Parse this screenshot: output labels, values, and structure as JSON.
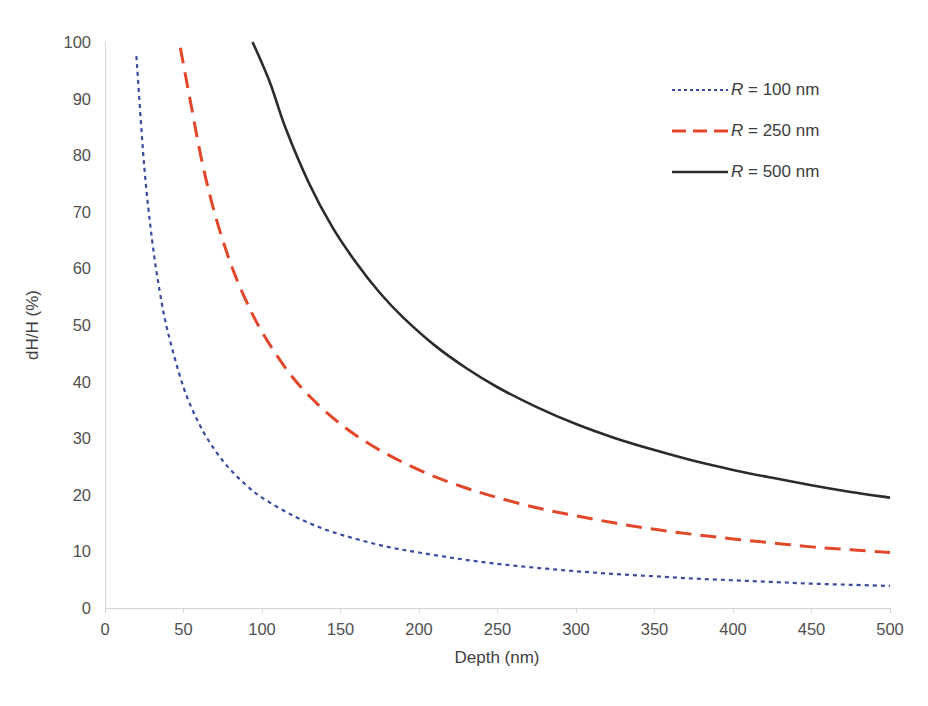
{
  "chart_data": {
    "type": "line",
    "title": "",
    "xlabel": "Depth (nm)",
    "ylabel": "dH/H (%)",
    "xlim": [
      0,
      500
    ],
    "ylim": [
      0,
      100
    ],
    "xticks": [
      0,
      50,
      100,
      150,
      200,
      250,
      300,
      350,
      400,
      450,
      500
    ],
    "yticks": [
      0,
      10,
      20,
      30,
      40,
      50,
      60,
      70,
      80,
      90,
      100
    ],
    "grid": false,
    "legend_position": "upper right",
    "series": [
      {
        "name": "R = 100 nm",
        "legend_symbol": "R",
        "legend_rest": " = 100 nm",
        "radius_nm": 100,
        "color": "#3b4ba0",
        "dash": "4,4",
        "width": 2.2,
        "x": [
          20,
          25,
          30,
          35,
          40,
          50,
          60,
          70,
          80,
          90,
          100,
          120,
          140,
          160,
          180,
          200,
          225,
          250,
          275,
          300,
          325,
          350,
          375,
          400,
          425,
          450,
          475,
          500
        ],
        "y": [
          97.5,
          78.0,
          65.0,
          55.7,
          48.8,
          39.0,
          32.5,
          27.9,
          24.4,
          21.7,
          19.5,
          16.3,
          13.9,
          12.2,
          10.8,
          9.8,
          8.7,
          7.8,
          7.1,
          6.5,
          6.0,
          5.6,
          5.2,
          4.9,
          4.6,
          4.3,
          4.1,
          3.9
        ]
      },
      {
        "name": "R = 250 nm",
        "legend_symbol": "R",
        "legend_rest": " = 250 nm",
        "radius_nm": 250,
        "color": "#e2472a",
        "dash": "16,9",
        "width": 3.0,
        "x": [
          48,
          55,
          62,
          70,
          80,
          90,
          100,
          115,
          130,
          150,
          170,
          190,
          210,
          230,
          250,
          275,
          300,
          325,
          350,
          375,
          400,
          425,
          450,
          475,
          500
        ],
        "y": [
          99.0,
          88.6,
          78.6,
          69.6,
          60.9,
          54.2,
          48.8,
          42.4,
          37.5,
          32.5,
          28.7,
          25.7,
          23.2,
          21.2,
          19.5,
          17.7,
          16.3,
          15.0,
          13.9,
          13.0,
          12.2,
          11.5,
          10.8,
          10.3,
          9.8
        ]
      },
      {
        "name": "R = 500 nm",
        "legend_symbol": "R",
        "legend_rest": " = 500 nm",
        "radius_nm": 500,
        "color": "#2b2b2b",
        "dash": "",
        "width": 2.6,
        "x": [
          94,
          105,
          115,
          130,
          145,
          160,
          175,
          190,
          210,
          230,
          250,
          275,
          300,
          325,
          350,
          375,
          400,
          425,
          450,
          475,
          500
        ],
        "y": [
          100.0,
          92.9,
          84.8,
          75.0,
          67.2,
          61.0,
          55.7,
          51.3,
          46.4,
          42.4,
          39.0,
          35.5,
          32.5,
          30.0,
          27.9,
          26.0,
          24.4,
          23.0,
          21.7,
          20.5,
          19.5
        ]
      }
    ]
  },
  "legend": {
    "items": [
      {
        "label_symbol": "R",
        "label_rest": " = 100 nm",
        "color": "#3b4ba0",
        "dash": "3,3",
        "width": 2.2
      },
      {
        "label_symbol": "R",
        "label_rest": " = 250 nm",
        "color": "#e2472a",
        "dash": "14,7",
        "width": 3.0
      },
      {
        "label_symbol": "R",
        "label_rest": " = 500 nm",
        "color": "#2b2b2b",
        "dash": "",
        "width": 2.6
      }
    ]
  },
  "colors": {
    "background": "#ffffff",
    "axis": "#d4d4d4",
    "text": "#404040",
    "series_blue": "#3b4ba0",
    "series_red": "#e2472a",
    "series_black": "#2b2b2b"
  }
}
